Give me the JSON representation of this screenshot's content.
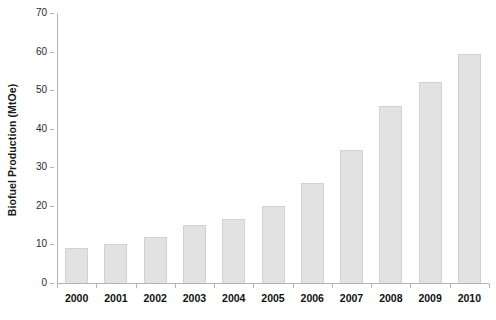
{
  "chart_data": {
    "type": "bar",
    "title": "",
    "xlabel": "",
    "ylabel": "Biofuel Production (MtOe)",
    "categories": [
      "2000",
      "2001",
      "2002",
      "2003",
      "2004",
      "2005",
      "2006",
      "2007",
      "2008",
      "2009",
      "2010"
    ],
    "values": [
      9,
      10,
      12,
      15,
      16.5,
      20,
      26,
      34.5,
      46,
      52,
      59.5
    ],
    "ylim": [
      0,
      70
    ],
    "yticks": [
      0,
      10,
      20,
      30,
      40,
      50,
      60,
      70
    ],
    "ytick_labels": [
      "0",
      "10",
      "20",
      "30",
      "40",
      "50",
      "60",
      "70"
    ],
    "grid": false,
    "legend": null,
    "bar_color": "#e2e2e2",
    "bar_border_color": "#d2d2d2",
    "axis_color": "#b4b4b4",
    "background": "#ffffff"
  }
}
